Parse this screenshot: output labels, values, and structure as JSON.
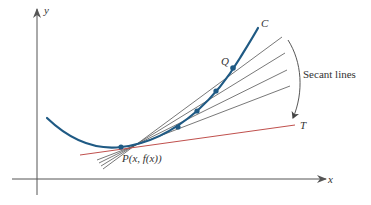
{
  "figure": {
    "axes": {
      "x_label": "x",
      "y_label": "y"
    },
    "curve": {
      "label": "C",
      "color": "#1f5a84"
    },
    "point_p": {
      "label": "P(x, f(x))"
    },
    "point_q": {
      "label": "Q"
    },
    "tangent": {
      "label": "T",
      "color": "#c0504d"
    },
    "secants": {
      "label": "Secant lines",
      "color": "#555555",
      "count": 4
    },
    "colors": {
      "axis": "#555555",
      "text": "#333333",
      "background": "#ffffff"
    }
  }
}
